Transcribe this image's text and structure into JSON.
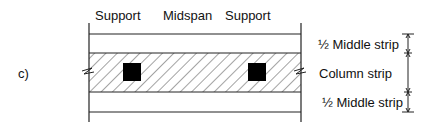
{
  "diagram": {
    "panel_label": "c)",
    "top_labels": [
      "Support",
      "Midspan",
      "Support"
    ],
    "strip_labels": {
      "top_half_middle": "½ Middle strip",
      "column": "Column strip",
      "bottom_half_middle": "½ Middle strip"
    },
    "colors": {
      "line": "#222222",
      "column_fill": "#000000",
      "background": "#ffffff"
    }
  }
}
